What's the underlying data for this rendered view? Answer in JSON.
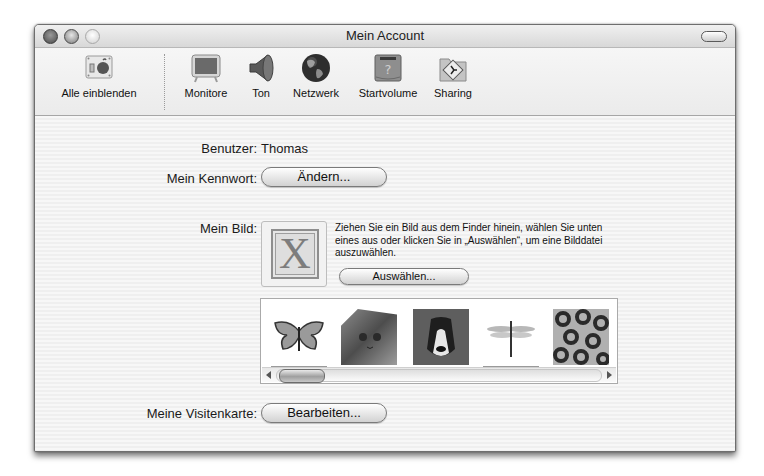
{
  "window": {
    "title": "Mein Account",
    "traffic_lights": [
      "close",
      "minimize",
      "zoom"
    ]
  },
  "toolbar": {
    "items": [
      {
        "label": "Alle einblenden",
        "icon": "show-all-icon"
      },
      {
        "label": "Monitore",
        "icon": "monitor-icon"
      },
      {
        "label": "Ton",
        "icon": "speaker-icon"
      },
      {
        "label": "Netzwerk",
        "icon": "globe-icon"
      },
      {
        "label": "Startvolume",
        "icon": "startup-disk-icon"
      },
      {
        "label": "Sharing",
        "icon": "sharing-folder-icon"
      }
    ]
  },
  "account": {
    "user_label": "Benutzer:",
    "user_value": "Thomas",
    "password_label": "Mein Kennwort:",
    "password_button": "Ändern...",
    "picture_label": "Mein Bild:",
    "picture_placeholder": "X",
    "picture_help": "Ziehen Sie ein Bild aus dem Finder hinein, wählen Sie unten eines aus oder klicken Sie in „Auswählen“, um eine Bilddatei auszuwählen.",
    "choose_button": "Auswählen...",
    "gallery": [
      {
        "name": "butterfly"
      },
      {
        "name": "cat"
      },
      {
        "name": "dog"
      },
      {
        "name": "dragonfly"
      },
      {
        "name": "leopard"
      }
    ],
    "card_label": "Meine Visitenkarte:",
    "card_button": "Bearbeiten..."
  }
}
